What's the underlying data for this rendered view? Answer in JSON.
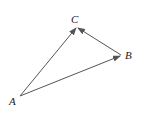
{
  "diagram": {
    "type": "vector-triangle",
    "points": {
      "A": {
        "label": "A",
        "x": 20,
        "y": 96
      },
      "B": {
        "label": "B",
        "x": 121,
        "y": 55
      },
      "C": {
        "label": "C",
        "x": 77,
        "y": 27
      }
    },
    "vectors": [
      {
        "from": "A",
        "to": "C"
      },
      {
        "from": "A",
        "to": "B"
      },
      {
        "from": "B",
        "to": "C"
      }
    ],
    "stroke_color": "#555555"
  }
}
